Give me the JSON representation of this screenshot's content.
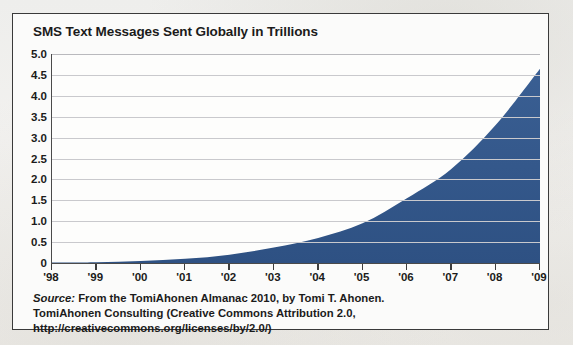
{
  "figure": {
    "title": "SMS Text Messages Sent Globally in Trillions",
    "source_label": "Source:",
    "source_line1": " From the TomiAhonen Almanac 2010, by Tomi T. Ahonen.",
    "source_line2": "TomiAhonen Consulting (Creative Commons Attribution 2.0,",
    "source_line3": "http://creativecommons.org/licenses/by/2.0/)"
  },
  "colors": {
    "area_fill": "#33588c",
    "area_fill_dark": "#2c4f80",
    "axis": "#4a4a4a",
    "gridline": "#c9c9cd",
    "text": "#1b1b1b",
    "panel_bg": "#fbfbfa",
    "page_bg": "#efefed"
  },
  "chart_data": {
    "type": "area",
    "title": "SMS Text Messages Sent Globally in Trillions",
    "xlabel": "",
    "ylabel": "Trillions",
    "x": [
      "'98",
      "'99",
      "'00",
      "'01",
      "'02",
      "'03",
      "'04",
      "'05",
      "'06",
      "'07",
      "'08",
      "'09"
    ],
    "values": [
      0.01,
      0.02,
      0.05,
      0.1,
      0.2,
      0.37,
      0.6,
      0.95,
      1.55,
      2.25,
      3.3,
      4.65
    ],
    "ylim": [
      0,
      5
    ],
    "ytick_values": [
      5.0,
      4.5,
      4.0,
      3.5,
      3.0,
      2.5,
      2.0,
      1.5,
      1.0,
      0.5,
      0
    ],
    "ytick_labels": [
      "5.0",
      "4.5",
      "4.0",
      "3.5",
      "3.0",
      "2.5",
      "2.0",
      "1.5",
      "1.0",
      "0.5",
      "0"
    ],
    "xtick_labels": [
      "'98",
      "'99",
      "'00",
      "'01",
      "'02",
      "'03",
      "'04",
      "'05",
      "'06",
      "'07",
      "'08",
      "'09"
    ],
    "grid": true,
    "legend": false,
    "series_name": "SMS text messages sent globally (trillions)"
  }
}
